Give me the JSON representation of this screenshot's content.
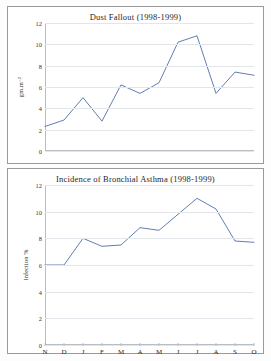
{
  "chart_data": [
    {
      "type": "line",
      "title": "Dust Fallout (1998-1999)",
      "xlabel": "",
      "ylabel": "gm.m⁻²",
      "categories": [
        "N",
        "D",
        "J",
        "F",
        "M",
        "A",
        "M",
        "J",
        "J",
        "A",
        "S",
        "O"
      ],
      "values": [
        2.3,
        2.9,
        5.0,
        2.8,
        6.2,
        5.4,
        6.4,
        10.2,
        10.8,
        5.4,
        7.4,
        7.1
      ],
      "ylim": [
        0,
        12
      ],
      "yticks": [
        0,
        2,
        4,
        6,
        8,
        10,
        12
      ],
      "grid": true,
      "legend": "none",
      "line_color": "#4f6fa8"
    },
    {
      "type": "line",
      "title": "Incidence of Bronchial Asthma (1998-1999)",
      "xlabel": "",
      "ylabel": "Infection %",
      "categories": [
        "N",
        "D",
        "J",
        "F",
        "M",
        "A",
        "M",
        "J",
        "J",
        "A",
        "S",
        "O"
      ],
      "values": [
        6.0,
        6.0,
        8.0,
        7.4,
        7.5,
        8.8,
        8.6,
        9.8,
        11.0,
        10.2,
        7.8,
        7.7
      ],
      "ylim": [
        0,
        12
      ],
      "yticks": [
        0,
        2,
        4,
        6,
        8,
        10,
        12
      ],
      "grid": true,
      "legend": "none",
      "line_color": "#4f6fa8"
    }
  ],
  "charts": {
    "top": {
      "title": "Dust Fallout (1998-1999)",
      "ylabel": "gm.m⁻²"
    },
    "bottom": {
      "title": "Incidence of Bronchial Asthma (1998-1999)",
      "ylabel": "Infection %"
    }
  },
  "axis": {
    "months": [
      "N",
      "D",
      "J",
      "F",
      "M",
      "A",
      "M",
      "J",
      "J",
      "A",
      "S",
      "O"
    ],
    "yticks": [
      "12",
      "10",
      "8",
      "6",
      "4",
      "2",
      "0"
    ]
  }
}
